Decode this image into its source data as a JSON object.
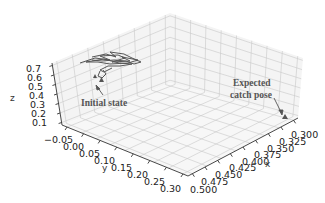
{
  "chart_data": {
    "type": "line3d",
    "title": "",
    "xlabel": "x",
    "ylabel": "y",
    "zlabel": "z",
    "x_ticks": [
      "0.300",
      "0.325",
      "0.350",
      "0.375",
      "0.400",
      "0.425",
      "0.450",
      "0.475",
      "0.500"
    ],
    "y_ticks": [
      "-0.05",
      "0.00",
      "0.05",
      "0.10",
      "0.15",
      "0.20",
      "0.25",
      "0.30"
    ],
    "z_ticks": [
      "0.1",
      "0.2",
      "0.3",
      "0.4",
      "0.5",
      "0.6",
      "0.7"
    ],
    "xlim": [
      0.3,
      0.5
    ],
    "ylim": [
      -0.05,
      0.3
    ],
    "zlim": [
      0.1,
      0.7
    ],
    "grid": true,
    "series": [
      {
        "name": "trajectory",
        "color": "#555555",
        "description": "tangled trajectory cluster near initial state",
        "approx_region": {
          "x": [
            0.48,
            0.5
          ],
          "y": [
            -0.05,
            0.05
          ],
          "z": [
            0.6,
            0.7
          ]
        }
      }
    ],
    "markers": [
      {
        "name": "initial_state",
        "shape": "triangle",
        "color": "#555555"
      },
      {
        "name": "expected_catch_pose",
        "shape": "triangle",
        "color": "#555555"
      }
    ],
    "annotations": [
      {
        "text": "Initial state",
        "target": "initial_state"
      },
      {
        "text": "Expected",
        "text2": "catch pose",
        "target": "expected_catch_pose"
      }
    ]
  },
  "labels": {
    "x": "x",
    "y": "y",
    "z": "z",
    "initial": "Initial state",
    "expected_line1": "Expected",
    "expected_line2": "catch pose"
  },
  "ticks": {
    "x": [
      "0.300",
      "0.325",
      "0.350",
      "0.375",
      "0.400",
      "0.425",
      "0.450",
      "0.475",
      "0.500"
    ],
    "y": [
      "−0.05",
      "0.00",
      "0.05",
      "0.10",
      "0.15",
      "0.20",
      "0.25",
      "0.30"
    ],
    "z": [
      "0.7",
      "0.6",
      "0.5",
      "0.4",
      "0.3",
      "0.2",
      "0.1"
    ]
  }
}
